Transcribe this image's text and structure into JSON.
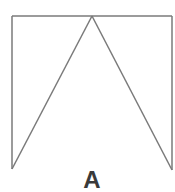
{
  "figure": {
    "label": "A",
    "stroke_color": "#7a7a7a",
    "label_color": "#3a3a3a",
    "background": "#ffffff",
    "shape": {
      "top_left": [
        12,
        16
      ],
      "top_right": [
        172,
        16
      ],
      "apex": [
        92,
        16
      ],
      "bottom_left": [
        12,
        169
      ],
      "bottom_right": [
        172,
        170
      ]
    }
  }
}
